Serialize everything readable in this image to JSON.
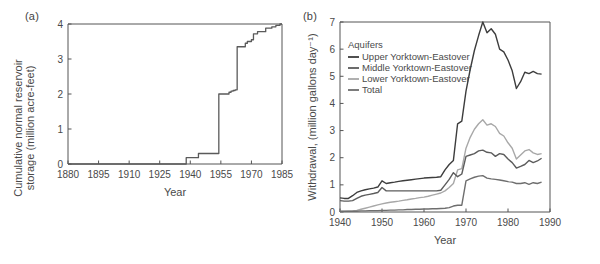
{
  "figure": {
    "background": "#ffffff",
    "panels": [
      "a",
      "b"
    ]
  },
  "panel_a": {
    "label": "(a)",
    "chart_data": {
      "type": "line",
      "title": "",
      "xlabel": "Year",
      "ylabel": "Cumulative normal reservoir storage (million acre-feet)",
      "xlim": [
        1880,
        1985
      ],
      "ylim": [
        0,
        4
      ],
      "xticks": [
        1880,
        1895,
        1910,
        1925,
        1940,
        1955,
        1970,
        1985
      ],
      "yticks": [
        0,
        1,
        2,
        3,
        4
      ],
      "grid": false,
      "legend": "none",
      "step_style": "post",
      "color": "#5a5a5a",
      "x": [
        1880,
        1938,
        1938,
        1944,
        1944,
        1953,
        1953,
        1954,
        1954,
        1959,
        1959,
        1960,
        1960,
        1961,
        1961,
        1962,
        1962,
        1963,
        1963,
        1967,
        1967,
        1968,
        1968,
        1970,
        1970,
        1971,
        1971,
        1973,
        1973,
        1977,
        1977,
        1980,
        1980,
        1982,
        1982,
        1984,
        1984,
        1985
      ],
      "y": [
        0.0,
        0.0,
        0.18,
        0.18,
        0.3,
        0.3,
        0.3,
        0.3,
        2.0,
        2.0,
        2.05,
        2.05,
        2.08,
        2.08,
        2.1,
        2.1,
        2.12,
        2.12,
        3.35,
        3.35,
        3.45,
        3.45,
        3.5,
        3.5,
        3.55,
        3.55,
        3.72,
        3.72,
        3.78,
        3.78,
        3.88,
        3.88,
        3.92,
        3.92,
        3.96,
        3.96,
        4.0,
        4.0
      ]
    }
  },
  "panel_b": {
    "label": "(b)",
    "legend": {
      "title": "Aquifers",
      "entries": [
        {
          "label": "Upper Yorktown-Eastover",
          "color": "#3d3d3d"
        },
        {
          "label": "Middle Yorktown-Eastover",
          "color": "#5c5c5c"
        },
        {
          "label": "Lower Yorktown-Eastover",
          "color": "#a8a8a8"
        },
        {
          "label": "Total",
          "color": "#6e6e6e"
        }
      ]
    },
    "chart_data": {
      "type": "line",
      "title": "",
      "xlabel": "Year",
      "ylabel": "Withdrawal, (million gallons day⁻¹)",
      "xlim": [
        1940,
        1990
      ],
      "ylim": [
        0,
        7
      ],
      "xticks": [
        1940,
        1950,
        1960,
        1970,
        1980,
        1990
      ],
      "yticks": [
        0,
        1,
        2,
        3,
        4,
        5,
        6,
        7
      ],
      "grid": false,
      "legend_position": "upper-left-inside",
      "x": [
        1940,
        1941,
        1942,
        1943,
        1944,
        1945,
        1946,
        1947,
        1948,
        1949,
        1950,
        1951,
        1952,
        1953,
        1954,
        1955,
        1956,
        1957,
        1958,
        1959,
        1960,
        1961,
        1962,
        1963,
        1964,
        1965,
        1966,
        1967,
        1968,
        1969,
        1970,
        1971,
        1972,
        1973,
        1974,
        1975,
        1976,
        1977,
        1978,
        1979,
        1980,
        1981,
        1982,
        1983,
        1984,
        1985,
        1986,
        1987,
        1988
      ],
      "series": [
        {
          "name": "Total",
          "color": "#3d3d3d",
          "values": [
            0.52,
            0.5,
            0.5,
            0.6,
            0.72,
            0.78,
            0.82,
            0.85,
            0.88,
            0.92,
            1.15,
            1.05,
            1.08,
            1.1,
            1.13,
            1.15,
            1.17,
            1.19,
            1.21,
            1.23,
            1.25,
            1.26,
            1.27,
            1.28,
            1.3,
            1.55,
            1.75,
            1.9,
            3.25,
            3.35,
            4.45,
            5.25,
            5.95,
            6.5,
            7.0,
            6.6,
            6.75,
            6.55,
            6.0,
            5.9,
            5.6,
            5.2,
            4.55,
            4.8,
            5.15,
            5.1,
            5.18,
            5.1,
            5.08
          ]
        },
        {
          "name": "Lower Yorktown-Eastover",
          "color": "#a8a8a8",
          "values": [
            0.02,
            0.02,
            0.03,
            0.04,
            0.06,
            0.1,
            0.14,
            0.18,
            0.22,
            0.26,
            0.3,
            0.33,
            0.36,
            0.38,
            0.4,
            0.43,
            0.45,
            0.48,
            0.5,
            0.53,
            0.55,
            0.58,
            0.62,
            0.66,
            0.7,
            0.78,
            0.9,
            1.05,
            1.55,
            1.6,
            2.35,
            2.75,
            3.05,
            3.25,
            3.4,
            3.2,
            3.25,
            3.15,
            2.9,
            2.8,
            2.55,
            2.35,
            1.95,
            2.1,
            2.25,
            2.3,
            2.18,
            2.12,
            2.15
          ]
        },
        {
          "name": "Middle Yorktown-Eastover",
          "color": "#5c5c5c",
          "values": [
            0.42,
            0.4,
            0.4,
            0.42,
            0.5,
            0.58,
            0.62,
            0.65,
            0.68,
            0.72,
            0.9,
            0.78,
            0.78,
            0.78,
            0.78,
            0.78,
            0.78,
            0.78,
            0.78,
            0.78,
            0.78,
            0.78,
            0.78,
            0.78,
            0.8,
            1.0,
            1.2,
            1.45,
            1.3,
            1.4,
            2.05,
            2.1,
            2.15,
            2.25,
            2.28,
            2.2,
            2.18,
            2.05,
            2.15,
            2.12,
            1.95,
            1.82,
            1.62,
            1.68,
            1.75,
            1.9,
            1.82,
            1.88,
            1.98
          ]
        },
        {
          "name": "Upper Yorktown-Eastover",
          "color": "#6e6e6e",
          "values": [
            0.03,
            0.03,
            0.03,
            0.03,
            0.03,
            0.04,
            0.04,
            0.05,
            0.05,
            0.05,
            0.06,
            0.06,
            0.07,
            0.07,
            0.08,
            0.08,
            0.09,
            0.09,
            0.1,
            0.1,
            0.11,
            0.11,
            0.12,
            0.12,
            0.13,
            0.14,
            0.16,
            0.22,
            0.25,
            0.25,
            1.15,
            1.22,
            1.28,
            1.32,
            1.34,
            1.25,
            1.22,
            1.2,
            1.18,
            1.15,
            1.12,
            1.1,
            1.05,
            1.05,
            1.08,
            1.02,
            1.08,
            1.05,
            1.1
          ]
        }
      ]
    }
  }
}
